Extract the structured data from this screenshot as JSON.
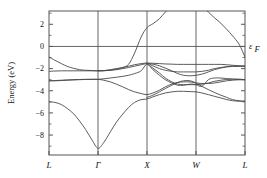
{
  "figure": {
    "title": "",
    "fermi_label": "ε",
    "fermi_sub": "F"
  },
  "chart_data": {
    "type": "line",
    "title": "",
    "xlabel": "",
    "ylabel": "Energy (eV)",
    "ylim": [
      -9.8,
      3.2
    ],
    "xlim": [
      0,
      3
    ],
    "grid": false,
    "legend": null,
    "fermi_level": 0,
    "fermi_label": "ε_F",
    "ytick_values": [
      2,
      0,
      -2,
      -4,
      -6,
      -8
    ],
    "ytick_labels": [
      "2",
      "0",
      "−2",
      "−4",
      "−6",
      "−8"
    ],
    "yminor_values": [
      3,
      1,
      -1,
      -3,
      -5,
      -7,
      -9
    ],
    "xtick_positions": [
      0,
      0.75,
      1.5,
      2.25,
      3
    ],
    "xtick_labels": [
      "L",
      "Γ",
      "X",
      "W",
      "L"
    ],
    "kpath": [
      "L",
      "Γ",
      "X",
      "W",
      "L"
    ],
    "series": [
      {
        "name": "band-1-valence-lowest",
        "x": [
          0,
          0.09,
          0.19,
          0.28,
          0.38,
          0.47,
          0.56,
          0.66,
          0.75,
          0.84,
          0.94,
          1.03,
          1.13,
          1.22,
          1.31,
          1.41,
          1.5,
          1.59,
          1.69,
          1.78,
          1.88,
          1.97,
          2.06,
          2.16,
          2.25,
          2.34,
          2.44,
          2.53,
          2.63,
          2.72,
          2.81,
          2.91,
          3
        ],
        "values": [
          -5.0,
          -5.05,
          -5.25,
          -5.6,
          -6.1,
          -6.75,
          -7.5,
          -8.45,
          -9.2,
          -8.65,
          -7.7,
          -6.85,
          -6.1,
          -5.5,
          -5.05,
          -4.8,
          -4.75,
          -4.55,
          -4.35,
          -4.2,
          -4.1,
          -4.05,
          -4.05,
          -4.08,
          -4.1,
          -4.2,
          -4.35,
          -4.5,
          -4.65,
          -4.8,
          -4.9,
          -4.95,
          -4.95
        ]
      },
      {
        "name": "band-2-valence",
        "x": [
          0,
          0.09,
          0.19,
          0.28,
          0.38,
          0.47,
          0.56,
          0.66,
          0.75,
          0.84,
          0.94,
          1.03,
          1.13,
          1.22,
          1.31,
          1.41,
          1.5,
          1.59,
          1.69,
          1.78,
          1.88,
          1.97,
          2.06,
          2.16,
          2.25,
          2.34,
          2.44,
          2.53,
          2.63,
          2.72,
          2.81,
          2.91,
          3
        ],
        "values": [
          -3.1,
          -3.08,
          -3.05,
          -3.02,
          -3.0,
          -2.98,
          -2.97,
          -2.97,
          -2.97,
          -3.05,
          -3.2,
          -3.4,
          -3.65,
          -3.9,
          -4.1,
          -4.25,
          -4.35,
          -4.2,
          -3.95,
          -3.65,
          -3.4,
          -3.25,
          -3.2,
          -3.2,
          -3.3,
          -3.35,
          -3.35,
          -3.3,
          -3.2,
          -3.1,
          -3.05,
          -3.0,
          -3.0
        ]
      },
      {
        "name": "band-3-valence",
        "x": [
          0,
          0.09,
          0.19,
          0.28,
          0.38,
          0.47,
          0.56,
          0.66,
          0.75,
          0.84,
          0.94,
          1.03,
          1.13,
          1.22,
          1.31,
          1.41,
          1.5,
          1.59,
          1.69,
          1.78,
          1.88,
          1.97,
          2.06,
          2.16,
          2.25,
          2.34,
          2.44,
          2.53,
          2.63,
          2.72,
          2.81,
          2.91,
          3
        ],
        "values": [
          -3.1,
          -3.1,
          -3.08,
          -3.05,
          -3.02,
          -3.0,
          -2.98,
          -2.97,
          -2.97,
          -2.92,
          -2.85,
          -2.78,
          -2.7,
          -2.6,
          -2.45,
          -2.2,
          -1.6,
          -2.1,
          -2.6,
          -3.0,
          -3.3,
          -3.5,
          -3.5,
          -3.4,
          -3.45,
          -3.6,
          -3.0,
          -2.85,
          -2.85,
          -2.9,
          -2.95,
          -3.0,
          -3.0
        ]
      },
      {
        "name": "band-4-valence-upper",
        "x": [
          0,
          0.09,
          0.19,
          0.28,
          0.38,
          0.47,
          0.56,
          0.66,
          0.75,
          0.84,
          0.94,
          1.03,
          1.13,
          1.22,
          1.31,
          1.41,
          1.5,
          1.59,
          1.69,
          1.78,
          1.88,
          1.97,
          2.06,
          2.16,
          2.25,
          2.34,
          2.44,
          2.53,
          2.63,
          2.72,
          2.81,
          2.91,
          3
        ],
        "values": [
          -2.25,
          -2.22,
          -2.2,
          -2.2,
          -2.2,
          -2.2,
          -2.2,
          -2.2,
          -2.2,
          -2.18,
          -2.15,
          -2.1,
          -2.0,
          -1.9,
          -1.78,
          -1.65,
          -1.55,
          -1.6,
          -1.75,
          -1.95,
          -2.2,
          -2.45,
          -2.6,
          -2.65,
          -2.6,
          -2.5,
          -2.3,
          -2.1,
          -1.95,
          -1.85,
          -1.8,
          -1.78,
          -1.78
        ]
      },
      {
        "name": "band-5-valence-top",
        "x": [
          0,
          0.09,
          0.19,
          0.28,
          0.38,
          0.47,
          0.56,
          0.66,
          0.75,
          0.84,
          0.94,
          1.03,
          1.13,
          1.22,
          1.31,
          1.41,
          1.5,
          1.59,
          1.69,
          1.78,
          1.88,
          1.97,
          2.06,
          2.16,
          2.25,
          2.34,
          2.44,
          2.53,
          2.63,
          2.72,
          2.81,
          2.91,
          3
        ],
        "values": [
          -0.95,
          -1.25,
          -1.55,
          -1.8,
          -1.98,
          -2.1,
          -2.15,
          -2.18,
          -2.2,
          -2.18,
          -2.1,
          -2.0,
          -1.9,
          -1.78,
          -1.65,
          -1.55,
          -1.5,
          -1.52,
          -1.55,
          -1.58,
          -1.6,
          -1.62,
          -1.62,
          -1.62,
          -1.62,
          -1.62,
          -1.62,
          -1.62,
          -1.62,
          -1.65,
          -1.7,
          -1.75,
          -1.78
        ]
      },
      {
        "name": "band-6-conduction-steep",
        "x": [
          0.75,
          0.84,
          0.94,
          1.03,
          1.13,
          1.22,
          1.31,
          1.41,
          1.5,
          1.59,
          1.69,
          1.78,
          1.88,
          1.97
        ],
        "values": [
          -2.2,
          -2.2,
          -2.15,
          -2.05,
          -1.9,
          -1.6,
          -0.6,
          0.85,
          1.7,
          2.05,
          2.5,
          3.1,
          3.6,
          4.2
        ]
      },
      {
        "name": "band-7-conduction-right",
        "x": [
          2.25,
          2.34,
          2.44,
          2.53,
          2.63,
          2.72,
          2.81,
          2.91,
          3
        ],
        "values": [
          4.2,
          3.6,
          3.1,
          2.6,
          2.1,
          1.55,
          0.95,
          0.2,
          -0.95
        ]
      },
      {
        "name": "band-8-midband-w",
        "x": [
          1.5,
          1.59,
          1.69,
          1.78,
          1.88,
          1.97,
          2.06,
          2.16,
          2.25,
          2.34,
          2.44,
          2.53,
          2.63,
          2.72,
          2.81,
          2.91,
          3
        ],
        "values": [
          -1.55,
          -1.95,
          -2.4,
          -2.85,
          -3.2,
          -3.4,
          -3.45,
          -3.45,
          -3.45,
          -3.4,
          -3.3,
          -3.15,
          -3.05,
          -2.98,
          -2.95,
          -2.95,
          -3.0
        ]
      },
      {
        "name": "band-9-midband-x-w",
        "x": [
          1.5,
          1.59,
          1.69,
          1.78,
          1.88,
          1.97,
          2.06,
          2.16,
          2.25,
          2.34,
          2.44,
          2.53,
          2.63,
          2.72,
          2.81,
          2.91,
          3
        ],
        "values": [
          -4.6,
          -4.4,
          -4.1,
          -3.8,
          -3.5,
          -3.25,
          -3.1,
          -3.1,
          -3.3,
          -3.6,
          -3.9,
          -4.15,
          -4.4,
          -4.6,
          -4.8,
          -4.9,
          -4.95
        ]
      },
      {
        "name": "band-10-upper-x-to-w",
        "x": [
          1.5,
          1.59,
          1.69,
          1.78,
          1.88,
          1.97,
          2.06,
          2.16,
          2.25,
          2.34,
          2.44,
          2.53,
          2.63,
          2.72,
          2.81,
          2.91,
          3
        ],
        "values": [
          -1.5,
          -1.75,
          -2.0,
          -2.15,
          -2.25,
          -2.3,
          -2.3,
          -2.3,
          -2.3,
          -2.25,
          -2.15,
          -2.0,
          -1.9,
          -1.82,
          -1.78,
          -1.78,
          -1.78
        ]
      }
    ]
  },
  "axes": {
    "ylabel": "Energy (eV)",
    "ytick_labels": [
      "2",
      "0",
      "−2",
      "−4",
      "−6",
      "−8"
    ],
    "xtick_labels": [
      "L",
      "Γ",
      "X",
      "W",
      "L"
    ]
  }
}
